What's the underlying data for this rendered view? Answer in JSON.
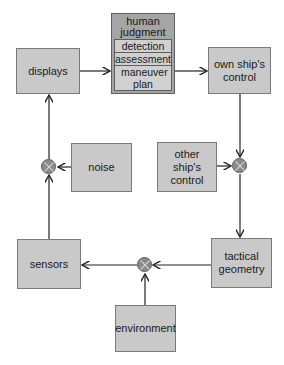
{
  "diagram": {
    "blocks": {
      "displays": "displays",
      "human_judgment": {
        "title": "human judgment",
        "steps": [
          "detection",
          "assessment",
          "maneuver plan"
        ]
      },
      "own_ship_control": "own ship's control",
      "other_ship_control": "other ship's control",
      "noise": "noise",
      "sensors": "sensors",
      "tactical_geometry": "tactical geometry",
      "environment": "environment"
    },
    "junctions": [
      "noise-summing-junction",
      "ship-control-summing-junction",
      "environment-summing-junction"
    ],
    "connections": [
      {
        "from": "displays",
        "to": "human judgment"
      },
      {
        "from": "human judgment",
        "to": "own ship's control"
      },
      {
        "from": "own ship's control",
        "to": "ship-control-summing-junction"
      },
      {
        "from": "other ship's control",
        "to": "ship-control-summing-junction"
      },
      {
        "from": "ship-control-summing-junction",
        "to": "tactical geometry"
      },
      {
        "from": "tactical geometry",
        "to": "environment-summing-junction"
      },
      {
        "from": "environment",
        "to": "environment-summing-junction"
      },
      {
        "from": "environment-summing-junction",
        "to": "sensors"
      },
      {
        "from": "sensors",
        "to": "noise-summing-junction"
      },
      {
        "from": "noise",
        "to": "noise-summing-junction"
      },
      {
        "from": "noise-summing-junction",
        "to": "displays"
      }
    ],
    "colors": {
      "block_fill": "#c9c9c9",
      "human_judgment_fill": "#a5a5a5",
      "junction_fill": "#8a8a8a",
      "line": "#222222"
    }
  }
}
